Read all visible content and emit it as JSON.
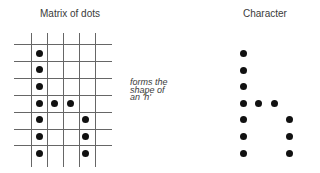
{
  "left_panel": {
    "title": "Matrix of dots",
    "grid": {
      "vertical_lines_x": [
        31,
        47,
        63,
        79,
        95
      ],
      "horizontal_lines_y": [
        44,
        61,
        78,
        95,
        112,
        129,
        145
      ],
      "x_range": [
        14,
        112
      ],
      "y_range": [
        33,
        167
      ]
    },
    "dots": [
      {
        "x": 39,
        "y": 53
      },
      {
        "x": 39,
        "y": 69
      },
      {
        "x": 39,
        "y": 86
      },
      {
        "x": 39,
        "y": 103
      },
      {
        "x": 54,
        "y": 103
      },
      {
        "x": 70,
        "y": 103
      },
      {
        "x": 39,
        "y": 119
      },
      {
        "x": 85,
        "y": 119
      },
      {
        "x": 39,
        "y": 136
      },
      {
        "x": 85,
        "y": 136
      },
      {
        "x": 39,
        "y": 153
      },
      {
        "x": 85,
        "y": 153
      }
    ]
  },
  "caption": {
    "lines": [
      "forms the",
      "shape of",
      "an 'h'"
    ]
  },
  "right_panel": {
    "title": "Character",
    "dots": [
      {
        "x": 243,
        "y": 53
      },
      {
        "x": 243,
        "y": 70
      },
      {
        "x": 243,
        "y": 86
      },
      {
        "x": 243,
        "y": 103
      },
      {
        "x": 258,
        "y": 103
      },
      {
        "x": 274,
        "y": 103
      },
      {
        "x": 243,
        "y": 119
      },
      {
        "x": 289,
        "y": 119
      },
      {
        "x": 243,
        "y": 136
      },
      {
        "x": 289,
        "y": 136
      },
      {
        "x": 243,
        "y": 153
      },
      {
        "x": 289,
        "y": 153
      }
    ]
  },
  "colors": {
    "dot": "#111111",
    "grid_line": "#666666",
    "text": "#3a3a3a"
  }
}
